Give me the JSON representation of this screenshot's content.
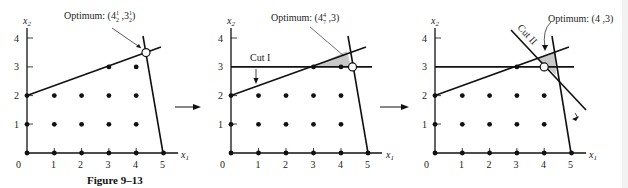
{
  "figure_caption": "Figure 9–13",
  "axis_labels": {
    "x": "x",
    "x_sub": "1",
    "y": "x",
    "y_sub": "2"
  },
  "x_ticks": [
    "0",
    "1",
    "2",
    "3",
    "4",
    "5"
  ],
  "y_ticks": [
    "1",
    "2",
    "3",
    "4"
  ],
  "panels": [
    {
      "id": "panel-1",
      "origin": [
        27,
        153
      ],
      "unit": [
        27.3,
        28.7
      ],
      "optimum_label": {
        "prefix": "Optimum: (4",
        "frac1_num": "1",
        "frac1_den": "2",
        "mid": " ,3",
        "frac2_num": "1",
        "frac2_den": "2",
        "suffix": ")"
      },
      "optimum_point": [
        4.45,
        3.45
      ],
      "cuts": []
    },
    {
      "id": "panel-2",
      "origin": [
        231,
        153
      ],
      "unit": [
        27.5,
        28.7
      ],
      "optimum_label": {
        "prefix": "Optimum: (4",
        "frac1_num": "4",
        "frac1_den": "7",
        "mid": " ,3",
        "suffix": ")"
      },
      "optimum_point": [
        4.57,
        3
      ],
      "cuts": [
        {
          "label": "Cut I"
        }
      ]
    },
    {
      "id": "panel-3",
      "origin": [
        435,
        153
      ],
      "unit": [
        27.3,
        28.7
      ],
      "optimum_label": {
        "text": "Optimum: (4 ,3)"
      },
      "optimum_point": [
        4,
        3
      ],
      "cuts": [
        {
          "label": "Cut I"
        },
        {
          "label": "Cut II"
        }
      ]
    }
  ],
  "integer_points": [
    [
      0,
      0
    ],
    [
      1,
      0
    ],
    [
      2,
      0
    ],
    [
      3,
      0
    ],
    [
      4,
      0
    ],
    [
      5,
      0
    ],
    [
      0,
      1
    ],
    [
      1,
      1
    ],
    [
      2,
      1
    ],
    [
      3,
      1
    ],
    [
      4,
      1
    ],
    [
      0,
      2
    ],
    [
      1,
      2
    ],
    [
      2,
      2
    ],
    [
      3,
      2
    ],
    [
      4,
      2
    ],
    [
      3,
      3
    ],
    [
      4,
      3
    ]
  ],
  "colors": {
    "line": "#111111",
    "shade": "#c8c8c8",
    "text": "#222222"
  }
}
